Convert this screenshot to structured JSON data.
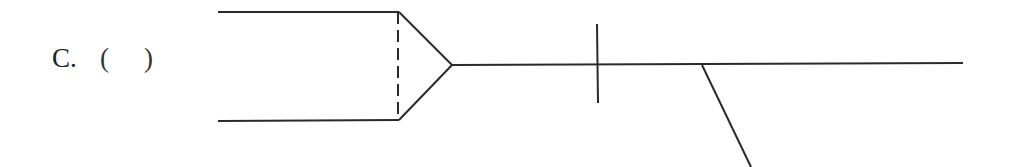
{
  "option": {
    "letter": "C.",
    "paren_open": "(",
    "paren_close": ")",
    "answer": ""
  },
  "diagram": {
    "stroke_color": "#2a2a2a",
    "stroke_width": 2,
    "dash_pattern": "12 6",
    "shapes": {
      "top_edge": {
        "x1": 218,
        "y1": 12,
        "x2": 399,
        "y2": 12
      },
      "bottom_edge": {
        "x1": 218,
        "y1": 121,
        "x2": 399,
        "y2": 120
      },
      "dashed_divider": {
        "x1": 398,
        "y1": 12,
        "x2": 398,
        "y2": 120
      },
      "arrow_upper": {
        "x1": 399,
        "y1": 12,
        "x2": 452,
        "y2": 65
      },
      "arrow_lower": {
        "x1": 399,
        "y1": 120,
        "x2": 452,
        "y2": 65
      },
      "main_line": {
        "x1": 452,
        "y1": 65,
        "x2": 963,
        "y2": 63
      },
      "tick_mark": {
        "x1": 597,
        "y1": 24,
        "x2": 598,
        "y2": 103
      },
      "branch_line": {
        "x1": 702,
        "y1": 65,
        "x2": 751,
        "y2": 167
      }
    }
  }
}
